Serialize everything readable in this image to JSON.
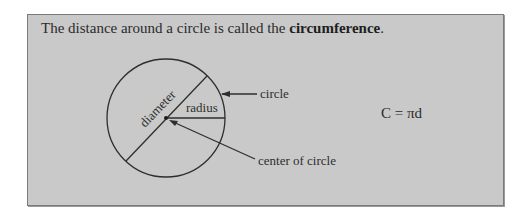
{
  "heading": {
    "prefix": "The distance around a circle is called the ",
    "term": "circumference",
    "suffix": "."
  },
  "diagram": {
    "labels": {
      "diameter": "diameter",
      "radius": "radius",
      "circle": "circle",
      "center": "center of circle"
    }
  },
  "formula": "C = πd",
  "colors": {
    "panel_bg": "#c9c9c9",
    "panel_border": "#7a7a7a",
    "ink": "#2b2b2b"
  }
}
